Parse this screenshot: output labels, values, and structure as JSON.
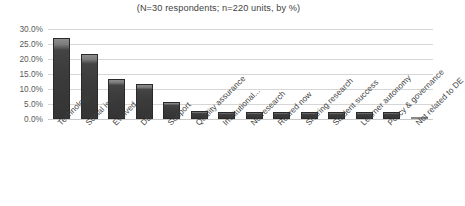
{
  "chart_data": {
    "type": "bar",
    "title": "(N=30 respondents; n=220 units, by %)",
    "xlabel": "",
    "ylabel": "",
    "ylim": [
      0,
      30
    ],
    "ytick_labels": [
      "30.0%",
      "25.0%",
      "20.0%",
      "15.0%",
      "10.0%",
      "5.0%",
      "0.0%"
    ],
    "ytick_values": [
      30,
      25,
      20,
      15,
      10,
      5,
      0
    ],
    "grid": true,
    "legend": "none",
    "bar_color": "#3b3b3b",
    "categories": [
      "Technology",
      "Social issues",
      "Evolved",
      "DE",
      "Support",
      "Quality assurance",
      "Institutional...",
      "No research",
      "Retired now",
      "Sharing research",
      "Student success",
      "Learner autonomy",
      "Policy & governance",
      "Not related to DE"
    ],
    "values": [
      27.0,
      21.6,
      13.3,
      11.7,
      5.7,
      2.6,
      2.3,
      2.3,
      2.3,
      2.3,
      2.3,
      2.3,
      2.3,
      0.5
    ]
  }
}
